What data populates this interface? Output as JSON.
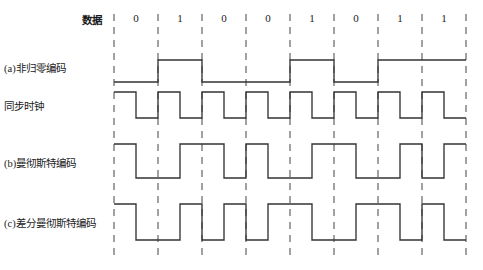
{
  "figure": {
    "title_label": "数据",
    "bit_labels": [
      "0",
      "1",
      "0",
      "0",
      "1",
      "0",
      "1",
      "1"
    ],
    "row_labels": [
      "(a)非归零编码",
      "同步时钟",
      "(b)曼彻斯特编码",
      "(c)差分曼彻斯特编码"
    ],
    "colors": {
      "waveform": "#333333",
      "gridline": "#555555",
      "background": "#ffffff",
      "text": "#1a1a1a"
    }
  },
  "chart_data": {
    "type": "line",
    "xlabel": "",
    "ylabel": "",
    "grid": true,
    "legend_position": "left",
    "bit_sequence": [
      0,
      1,
      0,
      0,
      1,
      0,
      1,
      1
    ],
    "bit_count": 8,
    "bit_width_px": 44,
    "x_start_px": 114,
    "x_end_px": 466,
    "gridline_x": [
      114,
      158,
      202,
      246,
      290,
      334,
      378,
      422,
      466
    ],
    "series": [
      {
        "name": "(a)非归零编码",
        "encoding": "NRZ",
        "description": "Level held for whole bit: 0 = low, 1 = high",
        "y_high_px": 60,
        "y_low_px": 82,
        "levels_per_bit": [
          [
            "low",
            "low"
          ],
          [
            "high",
            "high"
          ],
          [
            "low",
            "low"
          ],
          [
            "low",
            "low"
          ],
          [
            "high",
            "high"
          ],
          [
            "low",
            "low"
          ],
          [
            "high",
            "high"
          ],
          [
            "high",
            "high"
          ]
        ]
      },
      {
        "name": "同步时钟",
        "encoding": "Clock",
        "description": "Square clock, high for first half of each bit, low for second half",
        "y_high_px": 92,
        "y_low_px": 118,
        "levels_per_bit": [
          [
            "high",
            "low"
          ],
          [
            "high",
            "low"
          ],
          [
            "high",
            "low"
          ],
          [
            "high",
            "low"
          ],
          [
            "high",
            "low"
          ],
          [
            "high",
            "low"
          ],
          [
            "high",
            "low"
          ],
          [
            "high",
            "low"
          ]
        ]
      },
      {
        "name": "(b)曼彻斯特编码",
        "encoding": "Manchester",
        "description": "0 = high-to-low transition at mid-bit, 1 = low-to-high transition at mid-bit",
        "y_high_px": 144,
        "y_low_px": 178,
        "levels_per_bit": [
          [
            "high",
            "low"
          ],
          [
            "low",
            "high"
          ],
          [
            "high",
            "low"
          ],
          [
            "high",
            "low"
          ],
          [
            "low",
            "high"
          ],
          [
            "high",
            "low"
          ],
          [
            "low",
            "high"
          ],
          [
            "low",
            "high"
          ]
        ]
      },
      {
        "name": "(c)差分曼彻斯特编码",
        "encoding": "Differential Manchester",
        "description": "Always a transition at mid-bit; a 0 also has a transition at the bit boundary, a 1 does not",
        "y_high_px": 204,
        "y_low_px": 240,
        "levels_per_bit": [
          [
            "high",
            "low"
          ],
          [
            "low",
            "high"
          ],
          [
            "low",
            "high"
          ],
          [
            "low",
            "high"
          ],
          [
            "high",
            "low"
          ],
          [
            "low",
            "high"
          ],
          [
            "high",
            "low"
          ],
          [
            "high",
            "low"
          ]
        ]
      }
    ]
  }
}
